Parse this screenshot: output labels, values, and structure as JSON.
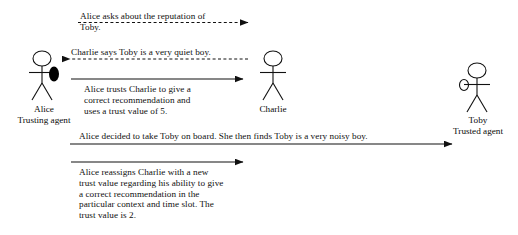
{
  "diagram": {
    "type": "uml-sequence-style-interaction",
    "background_color": "#ffffff",
    "line_color": "#111111"
  },
  "actors": [
    {
      "id": "alice",
      "name": "Alice",
      "role": "Trusting agent",
      "label": "Alice\nTrusting agent",
      "marker": "filled-ellipse",
      "marker_color": "#000000"
    },
    {
      "id": "charlie",
      "name": "Charlie",
      "role": "",
      "label": "Charlie",
      "marker": "none",
      "marker_color": ""
    },
    {
      "id": "toby",
      "name": "Toby",
      "role": "Trusted agent",
      "label": "Toby\nTrusted agent",
      "marker": "hollow-ellipse",
      "marker_color": "#ffffff"
    }
  ],
  "messages": [
    {
      "id": "m1",
      "text": "Alice asks about the  reputation of\nToby.",
      "line_style": "dashed",
      "direction": "right",
      "from": "alice",
      "to": "charlie"
    },
    {
      "id": "m2",
      "text": "Charlie says Toby is a very quiet boy.",
      "line_style": "dashed",
      "direction": "left",
      "from": "charlie",
      "to": "alice"
    },
    {
      "id": "m3",
      "text": "Alice trusts Charlie to give a\ncorrect recommendation and\nuses a trust value of 5.",
      "line_style": "solid",
      "direction": "right",
      "from": "alice",
      "to": "charlie"
    },
    {
      "id": "m4",
      "text": "Alice decided to take Toby on board. She then finds Toby is a very noisy boy.",
      "line_style": "solid",
      "direction": "right",
      "from": "alice",
      "to": "toby"
    },
    {
      "id": "m5",
      "text": "Alice reassigns Charlie with a new\ntrust value regarding his ability to give\na correct recommendation in the\nparticular context and time slot. The\ntrust value is 2.",
      "line_style": "solid",
      "direction": "right",
      "from": "alice",
      "to": "charlie"
    }
  ]
}
